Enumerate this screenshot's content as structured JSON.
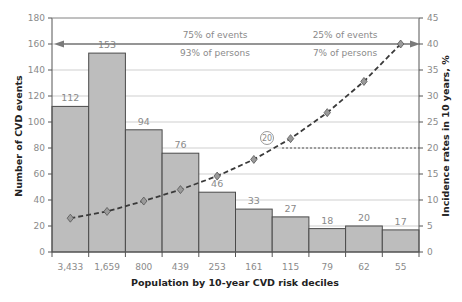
{
  "chart_data": {
    "type": "bar",
    "title": "",
    "xlabel": "Population by 10-year CVD risk deciles",
    "ylabel": "Number of CVD events",
    "y2label": "Incidence rates in 10 years, %",
    "categories": [
      "3,433",
      "1,659",
      "800",
      "439",
      "253",
      "161",
      "115",
      "79",
      "62",
      "55"
    ],
    "ylim": [
      0,
      180
    ],
    "y2lim": [
      0,
      45
    ],
    "yticks": [
      0,
      20,
      40,
      60,
      80,
      100,
      120,
      140,
      160,
      180
    ],
    "y2ticks": [
      0,
      5,
      10,
      15,
      20,
      25,
      30,
      35,
      40,
      45
    ],
    "grid": true,
    "series": [
      {
        "name": "Number of CVD events",
        "type": "bar",
        "axis": "left",
        "values": [
          112,
          153,
          94,
          76,
          46,
          33,
          27,
          18,
          20,
          17
        ]
      },
      {
        "name": "Incidence rates in 10 years, %",
        "type": "line",
        "axis": "right",
        "style": "dashed",
        "marker": "diamond",
        "values": [
          6.5,
          7.8,
          9.8,
          12.0,
          14.6,
          17.8,
          21.8,
          26.8,
          32.8,
          40.0
        ]
      }
    ],
    "annotations": {
      "arrow_left_text_top": "75% of events",
      "arrow_left_text_bottom": "93% of persons",
      "arrow_right_text_top": "25% of events",
      "arrow_right_text_bottom": "7% of persons",
      "circled_marker": "20",
      "reference_rate": 20
    },
    "colors": {
      "bar_fill": "#bdbdbd",
      "bar_stroke": "#4a4a4a",
      "line": "#3a3a3a",
      "marker_fill": "#9a9a9a",
      "grid": "#cfcfcf",
      "axis": "#555555",
      "text": "#8a8a8a"
    }
  }
}
